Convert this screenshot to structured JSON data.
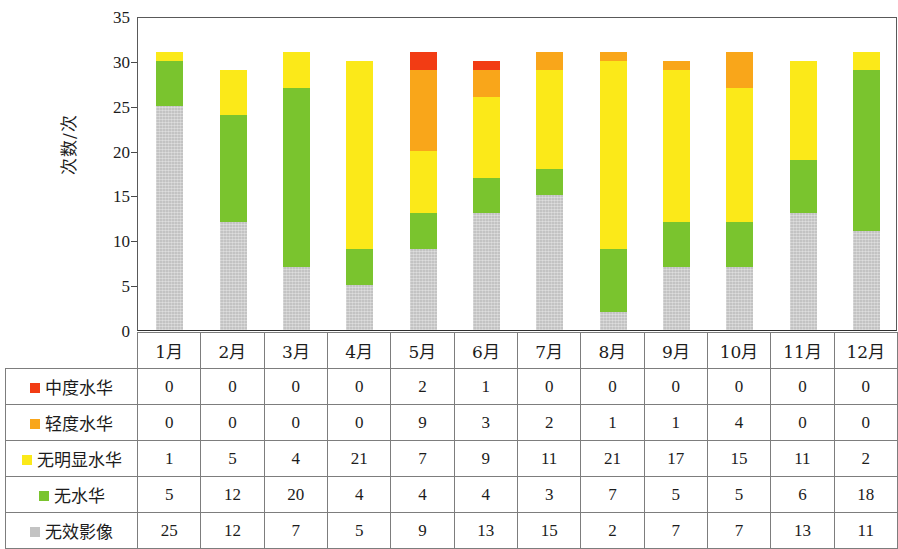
{
  "chart_data": {
    "type": "bar",
    "stacked": true,
    "title": "",
    "xlabel": "",
    "ylabel": "次数/次",
    "ylim": [
      0,
      35
    ],
    "yticks": [
      0,
      5,
      10,
      15,
      20,
      25,
      30,
      35
    ],
    "ytick_labels": [
      "0",
      "5",
      "10",
      "15",
      "20",
      "25",
      "30",
      "35"
    ],
    "grid": false,
    "legend_position": "table-row-labels",
    "categories": [
      "1月",
      "2月",
      "3月",
      "4月",
      "5月",
      "6月",
      "7月",
      "8月",
      "9月",
      "10月",
      "11月",
      "12月"
    ],
    "stack_order_bottom_to_top": [
      "无效影像",
      "无水华",
      "无明显水华",
      "轻度水华",
      "中度水华"
    ],
    "series": [
      {
        "name": "中度水华",
        "color": "#f23c14",
        "values": [
          0,
          0,
          0,
          0,
          2,
          1,
          0,
          0,
          0,
          0,
          0,
          0
        ]
      },
      {
        "name": "轻度水华",
        "color": "#f9a61a",
        "values": [
          0,
          0,
          0,
          0,
          9,
          3,
          2,
          1,
          1,
          4,
          0,
          0
        ]
      },
      {
        "name": "无明显水华",
        "color": "#fbe919",
        "values": [
          1,
          5,
          4,
          21,
          7,
          9,
          11,
          21,
          17,
          15,
          11,
          2
        ]
      },
      {
        "name": "无水华",
        "color": "#7ac42e",
        "values": [
          5,
          12,
          20,
          4,
          4,
          4,
          3,
          7,
          5,
          5,
          6,
          18
        ]
      },
      {
        "name": "无效影像",
        "color": "#c3c3c3",
        "values": [
          25,
          12,
          7,
          5,
          9,
          13,
          15,
          2,
          7,
          7,
          13,
          11
        ]
      }
    ],
    "totals": [
      31,
      29,
      31,
      30,
      31,
      30,
      31,
      31,
      30,
      31,
      30,
      31
    ]
  },
  "axis": {
    "y_title": "次数/次",
    "ticks": [
      {
        "value": 35,
        "label": "35"
      },
      {
        "value": 30,
        "label": "30"
      },
      {
        "value": 25,
        "label": "25"
      },
      {
        "value": 20,
        "label": "20"
      },
      {
        "value": 15,
        "label": "15"
      },
      {
        "value": 10,
        "label": "10"
      },
      {
        "value": 5,
        "label": "5"
      },
      {
        "value": 0,
        "label": "0"
      }
    ]
  },
  "table": {
    "corner_label": "",
    "column_headers": [
      "1月",
      "2月",
      "3月",
      "4月",
      "5月",
      "6月",
      "7月",
      "8月",
      "9月",
      "10月",
      "11月",
      "12月"
    ],
    "rows": [
      {
        "label": "中度水华",
        "color": "#f23c14",
        "values": [
          "0",
          "0",
          "0",
          "0",
          "2",
          "1",
          "0",
          "0",
          "0",
          "0",
          "0",
          "0"
        ]
      },
      {
        "label": "轻度水华",
        "color": "#f9a61a",
        "values": [
          "0",
          "0",
          "0",
          "0",
          "9",
          "3",
          "2",
          "1",
          "1",
          "4",
          "0",
          "0"
        ]
      },
      {
        "label": "无明显水华",
        "color": "#fbe919",
        "values": [
          "1",
          "5",
          "4",
          "21",
          "7",
          "9",
          "11",
          "21",
          "17",
          "15",
          "11",
          "2"
        ]
      },
      {
        "label": "无水华",
        "color": "#7ac42e",
        "values": [
          "5",
          "12",
          "20",
          "4",
          "4",
          "4",
          "3",
          "7",
          "5",
          "5",
          "6",
          "18"
        ]
      },
      {
        "label": "无效影像",
        "color": "#c3c3c3",
        "values": [
          "25",
          "12",
          "7",
          "5",
          "9",
          "13",
          "15",
          "2",
          "7",
          "7",
          "13",
          "11"
        ]
      }
    ]
  },
  "colors": {
    "moderate_bloom": "#f23c14",
    "light_bloom": "#f9a61a",
    "no_obvious_bloom": "#fbe919",
    "no_bloom": "#7ac42e",
    "invalid_image": "#c3c3c3",
    "axis_line": "#595959",
    "table_border": "#7d7d7d",
    "text": "#1c1c1c"
  }
}
